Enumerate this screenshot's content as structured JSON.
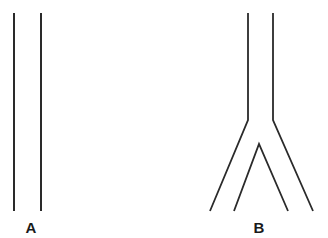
{
  "figures": [
    {
      "id": "A",
      "label": "A",
      "description": "Two parallel straight vertical lines (unbranched tube)",
      "label_pos": [
        31,
        219
      ]
    },
    {
      "id": "B",
      "label": "B",
      "description": "Tube that splits into two diverging branches (bifurcation)",
      "label_pos": [
        259,
        219
      ]
    }
  ],
  "colors": {
    "stroke": "#2a2a2a",
    "background": "#ffffff"
  }
}
